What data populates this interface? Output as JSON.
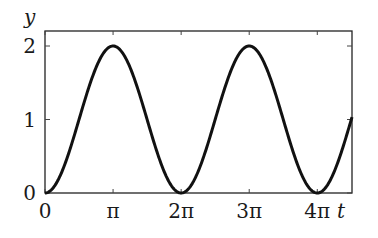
{
  "chart_data": {
    "type": "line",
    "title": "",
    "xlabel": "t",
    "ylabel": "y",
    "xlim_pi": [
      0,
      4.51
    ],
    "ylim": [
      0,
      2.2
    ],
    "grid": false,
    "legend": null,
    "function": "y = 1 - cos(t)",
    "x_ticks": [
      {
        "value_pi": 0,
        "label": "0"
      },
      {
        "value_pi": 1,
        "label": "π"
      },
      {
        "value_pi": 2,
        "label": "2π"
      },
      {
        "value_pi": 3,
        "label": "3π"
      },
      {
        "value_pi": 4,
        "label": "4π"
      }
    ],
    "y_ticks": [
      {
        "value": 0,
        "label": "0"
      },
      {
        "value": 1,
        "label": "1"
      },
      {
        "value": 2,
        "label": "2"
      }
    ],
    "series": [
      {
        "name": "y(t)",
        "x": [
          "0",
          "π/2",
          "π",
          "3π/2",
          "2π",
          "5π/2",
          "3π",
          "7π/2",
          "4π",
          "4.5π"
        ],
        "values": [
          0,
          1,
          2,
          1,
          0,
          1,
          2,
          1,
          0,
          1
        ]
      }
    ],
    "line_color": "#111111"
  }
}
